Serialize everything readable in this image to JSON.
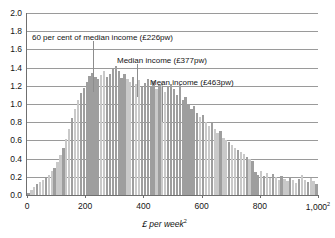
{
  "chart_data": {
    "type": "bar",
    "title": "",
    "subtitle": "",
    "xlabel": "£ per week",
    "xlabel_footnote": "2",
    "ylabel": "",
    "xlim": [
      0,
      1000
    ],
    "ylim": [
      0.0,
      2.0
    ],
    "grid": true,
    "legend": "none",
    "bin_width": 10,
    "y_ticks": [
      "0.0",
      "0.2",
      "0.4",
      "0.6",
      "0.8",
      "1.0",
      "1.2",
      "1.4",
      "1.6",
      "1.8",
      "2.0"
    ],
    "y_tick_values": [
      0.0,
      0.2,
      0.4,
      0.6,
      0.8,
      1.0,
      1.2,
      1.4,
      1.6,
      1.8,
      2.0
    ],
    "x_ticks": [
      "0",
      "200",
      "400",
      "600",
      "800",
      "1,000"
    ],
    "x_tick_values": [
      0,
      200,
      400,
      600,
      800,
      1000
    ],
    "bar_color_light": "#c9c9c9",
    "bar_color_dark": "#9e9e9e",
    "gridline_color": "#9a9a9a",
    "axis_color": "#6f6f6f",
    "x": [
      5,
      15,
      25,
      35,
      45,
      55,
      65,
      75,
      85,
      95,
      105,
      115,
      125,
      135,
      145,
      155,
      165,
      175,
      185,
      195,
      205,
      215,
      225,
      235,
      245,
      255,
      265,
      275,
      285,
      295,
      305,
      315,
      325,
      335,
      345,
      355,
      365,
      375,
      385,
      395,
      405,
      415,
      425,
      435,
      445,
      455,
      465,
      475,
      485,
      495,
      505,
      515,
      525,
      535,
      545,
      555,
      565,
      575,
      585,
      595,
      605,
      615,
      625,
      635,
      645,
      655,
      665,
      675,
      685,
      695,
      705,
      715,
      725,
      735,
      745,
      755,
      765,
      775,
      785,
      795,
      805,
      815,
      825,
      835,
      845,
      855,
      865,
      875,
      885,
      895,
      905,
      915,
      925,
      935,
      945,
      955,
      965,
      975,
      985,
      995
    ],
    "values": [
      0.02,
      0.05,
      0.09,
      0.12,
      0.14,
      0.16,
      0.19,
      0.22,
      0.26,
      0.3,
      0.36,
      0.44,
      0.52,
      0.62,
      0.73,
      0.85,
      0.95,
      1.04,
      1.12,
      1.18,
      1.24,
      1.31,
      1.34,
      1.3,
      1.27,
      1.32,
      1.36,
      1.3,
      1.33,
      1.38,
      1.42,
      1.36,
      1.29,
      1.33,
      1.27,
      1.24,
      1.3,
      1.22,
      1.26,
      1.19,
      1.23,
      1.28,
      1.2,
      1.25,
      1.17,
      1.21,
      1.24,
      1.13,
      1.19,
      1.22,
      1.16,
      1.1,
      1.21,
      1.04,
      1.08,
      1.0,
      0.95,
      0.98,
      0.9,
      0.86,
      0.88,
      0.8,
      0.76,
      0.79,
      0.72,
      0.68,
      0.7,
      0.63,
      0.6,
      0.58,
      0.55,
      0.52,
      0.5,
      0.47,
      0.45,
      0.42,
      0.4,
      0.37,
      0.25,
      0.22,
      0.26,
      0.21,
      0.24,
      0.19,
      0.23,
      0.2,
      0.17,
      0.21,
      0.18,
      0.15,
      0.19,
      0.16,
      0.13,
      0.18,
      0.22,
      0.17,
      0.14,
      0.19,
      0.15,
      0.12
    ],
    "shade_groups": [
      {
        "from": 190,
        "to": 250
      },
      {
        "from": 280,
        "to": 330
      },
      {
        "from": 400,
        "to": 440
      },
      {
        "from": 480,
        "to": 590
      },
      {
        "from": 770,
        "to": 800
      }
    ],
    "annotations": [
      {
        "name": "sixty-per-cent-median",
        "label": "60 per cent of median income (£226pw)",
        "value": 226,
        "label_x_px": 32,
        "label_y_px": 34,
        "line_top_px": 41,
        "line_bottom_px": 92
      },
      {
        "name": "median-income",
        "label": "Median income (£377pw)",
        "value": 377,
        "label_x_px": 117,
        "label_y_px": 57,
        "line_top_px": 64,
        "line_bottom_px": 97
      },
      {
        "name": "mean-income",
        "label": "Mean income (£463pw)",
        "value": 463,
        "label_x_px": 150,
        "label_y_px": 79,
        "line_top_px": 86,
        "line_bottom_px": 122
      }
    ]
  }
}
